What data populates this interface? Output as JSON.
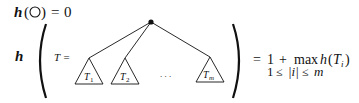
{
  "base_case": {
    "func": "h",
    "arg_open": "(",
    "empty_tree_symbol": "○",
    "arg_close": ")",
    "equals": "=",
    "value": "0"
  },
  "recursive_case": {
    "func": "h",
    "tree_label": "T =",
    "subtrees": [
      {
        "label": "T",
        "sub": "1"
      },
      {
        "label": "T",
        "sub": "2"
      },
      {
        "label": "T",
        "sub": "m"
      }
    ],
    "ellipsis": ". . .",
    "rhs_line1": {
      "equals": "=",
      "one": "1",
      "plus": "+",
      "max": "max",
      "func": "h",
      "open": "(",
      "T": "T",
      "sub_i": "i",
      "close": ")"
    },
    "rhs_line2": {
      "lower": "1",
      "le1": "≤",
      "bar_i": "|i|",
      "le2": "≤",
      "upper": "m"
    }
  }
}
